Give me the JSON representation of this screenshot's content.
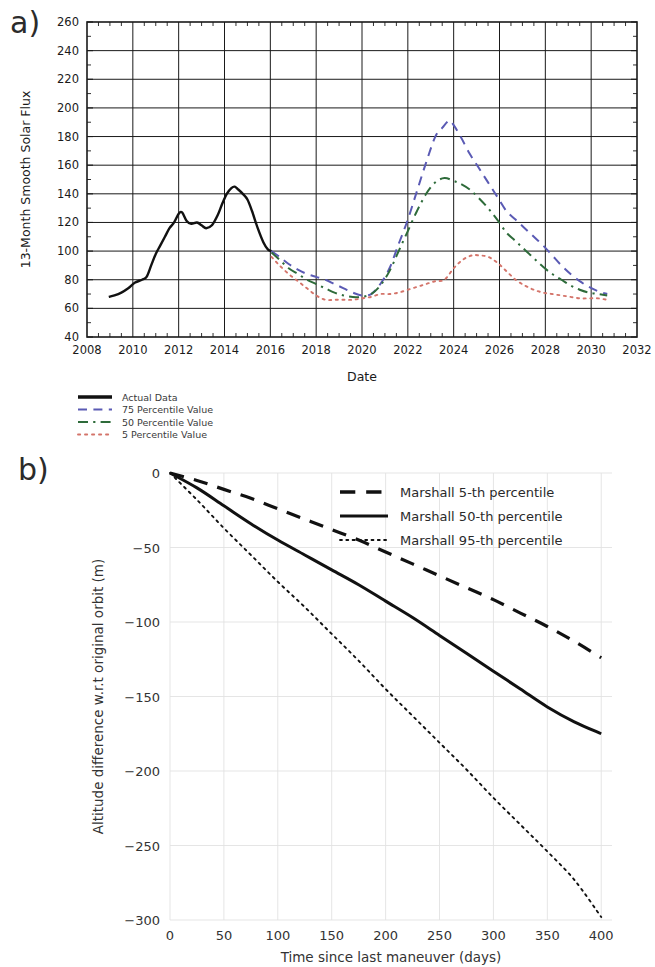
{
  "figure": {
    "panel_a_label": "a)",
    "panel_b_label": "b)"
  },
  "chart_data": [
    {
      "type": "line",
      "panel": "a)",
      "title": "",
      "xlabel": "Date",
      "ylabel": "13-Month Smooth Solar Flux",
      "xlim": [
        2008,
        2032
      ],
      "ylim": [
        40,
        260
      ],
      "xticks": [
        2008,
        2010,
        2012,
        2014,
        2016,
        2018,
        2020,
        2022,
        2024,
        2026,
        2028,
        2030,
        2032
      ],
      "yticks": [
        40,
        60,
        80,
        100,
        120,
        140,
        160,
        180,
        200,
        220,
        240,
        260
      ],
      "grid": true,
      "legend_position": "below-left",
      "series": [
        {
          "name": "Actual Data",
          "style": "solid",
          "color": "#111111",
          "x": [
            2008.95,
            2009.2,
            2009.5,
            2009.8,
            2010.1,
            2010.4,
            2010.6,
            2010.8,
            2011.0,
            2011.2,
            2011.4,
            2011.6,
            2011.8,
            2012.0,
            2012.15,
            2012.35,
            2012.55,
            2012.8,
            2013.0,
            2013.2,
            2013.45,
            2013.7,
            2013.9,
            2014.1,
            2014.3,
            2014.45,
            2014.6,
            2014.8,
            2015.0,
            2015.2,
            2015.45,
            2015.7,
            2015.9,
            2016.05
          ],
          "y": [
            68,
            69,
            71,
            74,
            78,
            80,
            82,
            90,
            98,
            104,
            110,
            116,
            120,
            126,
            127,
            121,
            119,
            120,
            118,
            116,
            118,
            125,
            133,
            140,
            144,
            145,
            143,
            140,
            136,
            128,
            116,
            106,
            101,
            100
          ]
        },
        {
          "name": "75 Percentile Value",
          "style": "dashed",
          "color": "#5a5ab4",
          "x": [
            2016.05,
            2016.4,
            2016.8,
            2017.2,
            2017.6,
            2018.0,
            2018.4,
            2018.8,
            2019.2,
            2019.6,
            2020.0,
            2020.4,
            2020.8,
            2021.2,
            2021.6,
            2022.0,
            2022.4,
            2022.8,
            2023.2,
            2023.5,
            2023.8,
            2024.0,
            2024.3,
            2024.7,
            2025.1,
            2025.5,
            2025.9,
            2026.3,
            2026.7,
            2027.1,
            2027.5,
            2027.9,
            2028.3,
            2028.7,
            2029.1,
            2029.5,
            2029.9,
            2030.3,
            2030.7
          ],
          "y": [
            100,
            96,
            91,
            87,
            84,
            82,
            80,
            77,
            74,
            71,
            69,
            70,
            77,
            88,
            105,
            122,
            142,
            162,
            180,
            186,
            191,
            188,
            180,
            168,
            158,
            148,
            138,
            128,
            122,
            116,
            110,
            104,
            97,
            90,
            84,
            79,
            75,
            72,
            70
          ]
        },
        {
          "name": "50 Percentile Value",
          "style": "dashdot",
          "color": "#2e6b3a",
          "x": [
            2016.05,
            2016.4,
            2016.8,
            2017.2,
            2017.6,
            2018.0,
            2018.4,
            2018.8,
            2019.2,
            2019.6,
            2020.0,
            2020.4,
            2020.8,
            2021.2,
            2021.6,
            2022.0,
            2022.4,
            2022.8,
            2023.2,
            2023.6,
            2024.0,
            2024.3,
            2024.7,
            2025.1,
            2025.5,
            2025.9,
            2026.3,
            2026.7,
            2027.1,
            2027.5,
            2027.9,
            2028.3,
            2028.7,
            2029.1,
            2029.5,
            2029.9,
            2030.3,
            2030.7
          ],
          "y": [
            99,
            94,
            88,
            84,
            80,
            77,
            74,
            71,
            69,
            68,
            68,
            70,
            76,
            86,
            100,
            114,
            128,
            140,
            148,
            151,
            149,
            147,
            143,
            137,
            130,
            122,
            113,
            107,
            101,
            95,
            89,
            84,
            80,
            76,
            73,
            71,
            70,
            69
          ]
        },
        {
          "name": "5 Percentile Value",
          "style": "dotted",
          "color": "#d4746a",
          "x": [
            2016.05,
            2016.4,
            2016.8,
            2017.2,
            2017.6,
            2018.0,
            2018.4,
            2018.8,
            2019.2,
            2019.6,
            2020.0,
            2020.4,
            2020.8,
            2021.2,
            2021.6,
            2022.0,
            2022.4,
            2022.8,
            2023.2,
            2023.6,
            2024.0,
            2024.4,
            2024.8,
            2025.1,
            2025.5,
            2025.9,
            2026.3,
            2026.7,
            2027.1,
            2027.5,
            2027.9,
            2028.3,
            2028.7,
            2029.1,
            2029.5,
            2029.9,
            2030.3,
            2030.7
          ],
          "y": [
            96,
            90,
            84,
            79,
            74,
            69,
            66,
            66,
            66,
            66,
            67,
            68,
            70,
            70,
            71,
            73,
            75,
            77,
            79,
            80,
            88,
            94,
            97,
            97,
            96,
            92,
            86,
            80,
            76,
            73,
            71,
            70,
            69,
            68,
            67,
            67,
            67,
            66
          ]
        }
      ]
    },
    {
      "type": "line",
      "panel": "b)",
      "title": "",
      "xlabel": "Time since last maneuver (days)",
      "ylabel": "Altitude difference w.r.t original orbit (m)",
      "xlim": [
        0,
        410
      ],
      "ylim": [
        -300,
        0
      ],
      "xticks": [
        0,
        50,
        100,
        150,
        200,
        250,
        300,
        350,
        400
      ],
      "yticks": [
        0,
        -50,
        -100,
        -150,
        -200,
        -250,
        -300
      ],
      "grid": true,
      "legend_position": "top-right",
      "series": [
        {
          "name": "Marshall 5-th percentile",
          "style": "dashed",
          "color": "#111111",
          "x": [
            0,
            25,
            50,
            75,
            100,
            125,
            150,
            175,
            200,
            225,
            250,
            275,
            300,
            325,
            350,
            375,
            400
          ],
          "y": [
            0,
            -5,
            -11,
            -17,
            -24,
            -31,
            -38,
            -45,
            -53,
            -61,
            -69,
            -77,
            -85,
            -94,
            -103,
            -113,
            -124
          ]
        },
        {
          "name": "Marshall 50-th percentile",
          "style": "solid",
          "color": "#111111",
          "x": [
            0,
            25,
            50,
            75,
            100,
            125,
            150,
            175,
            200,
            225,
            250,
            275,
            300,
            325,
            350,
            375,
            400
          ],
          "y": [
            0,
            -10,
            -22,
            -34,
            -45,
            -55,
            -65,
            -75,
            -86,
            -97,
            -109,
            -121,
            -133,
            -145,
            -157,
            -167,
            -175
          ]
        },
        {
          "name": "Marshall 95-th percentile",
          "style": "dotted",
          "color": "#111111",
          "x": [
            0,
            25,
            50,
            75,
            100,
            125,
            150,
            175,
            200,
            225,
            250,
            275,
            300,
            325,
            350,
            375,
            400
          ],
          "y": [
            0,
            -18,
            -37,
            -55,
            -73,
            -90,
            -108,
            -126,
            -145,
            -163,
            -181,
            -199,
            -218,
            -236,
            -254,
            -273,
            -298
          ]
        }
      ]
    }
  ]
}
